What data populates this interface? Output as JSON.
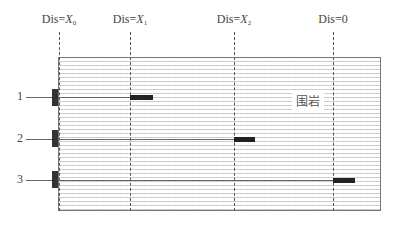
{
  "diagram": {
    "region_label": "围岩",
    "positions": [
      {
        "prefix": "Dis=",
        "var": "X",
        "sub": "0",
        "x": 59
      },
      {
        "prefix": "Dis=",
        "var": "X",
        "sub": "1",
        "x": 130
      },
      {
        "prefix": "Dis=",
        "var": "X",
        "sub": "2",
        "x": 234
      },
      {
        "prefix": "Dis=",
        "var": "0",
        "sub": "",
        "x": 333
      }
    ],
    "rows": [
      {
        "label": "1",
        "y": 97,
        "bar_x": 130
      },
      {
        "label": "2",
        "y": 139,
        "bar_x": 234
      },
      {
        "label": "3",
        "y": 180,
        "bar_x": 333
      }
    ]
  }
}
